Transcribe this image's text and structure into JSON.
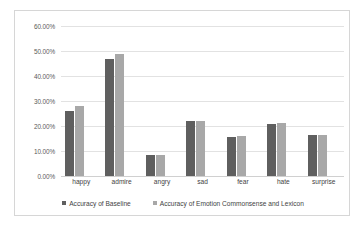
{
  "chart_data": {
    "type": "bar",
    "title": "",
    "xlabel": "",
    "ylabel": "",
    "categories": [
      "happy",
      "admire",
      "angry",
      "sad",
      "fear",
      "hate",
      "surprise"
    ],
    "series": [
      {
        "name": "Accuracy of Baseline",
        "color": "#5f5f5f",
        "values": [
          26.1,
          47.0,
          8.6,
          21.9,
          15.8,
          20.7,
          16.4
        ]
      },
      {
        "name": "Accuracy of Emotion Commonsense and Lexicon",
        "color": "#a8a8a8",
        "values": [
          28.2,
          48.8,
          8.5,
          22.2,
          15.9,
          21.3,
          16.6
        ]
      }
    ],
    "ylim": [
      0,
      60
    ],
    "ytick_labels": [
      "0.00%",
      "10.00%",
      "20.00%",
      "30.00%",
      "40.00%",
      "50.00%",
      "60.00%"
    ],
    "ytick_values": [
      0,
      10,
      20,
      30,
      40,
      50,
      60
    ],
    "grid": true,
    "legend_position": "bottom"
  }
}
